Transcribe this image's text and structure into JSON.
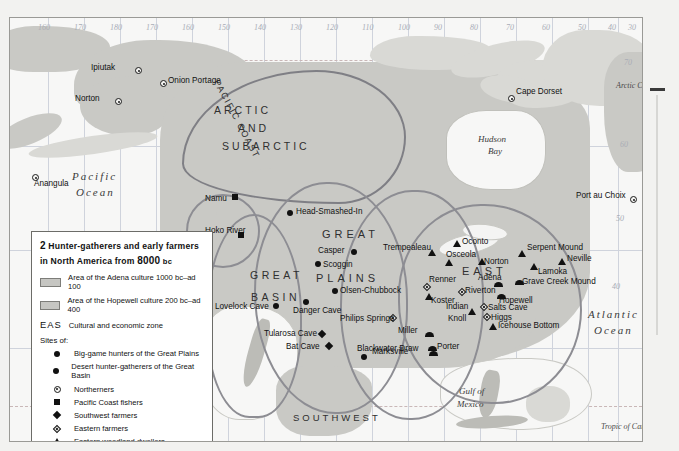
{
  "legend": {
    "number": "2",
    "title_line1": "Hunter-gatherers and early farmers",
    "title_line2_a": "in North America from",
    "title_line2_b": "8000",
    "title_line2_c": "bc",
    "swatches": [
      {
        "label": "Area of the Adena culture 1000 bc–ad 100",
        "color": "#c6c6c2"
      },
      {
        "label": "Area of the Hopewell culture 200 bc–ad 400",
        "color": "#c6c6c2"
      }
    ],
    "zone_key_abbr": "EAS",
    "zone_key_label": "Cultural and economic zone",
    "sites_header": "Sites of:",
    "site_types": [
      {
        "symbol": "filled-circle",
        "label": "Big-game hunters of the Great Plains"
      },
      {
        "symbol": "filled-circle",
        "label": "Desert hunter-gatherers of the Great Basin"
      },
      {
        "symbol": "ringed-circle",
        "label": "Northerners"
      },
      {
        "symbol": "filled-square",
        "label": "Pacific Coast fishers"
      },
      {
        "symbol": "filled-diamond",
        "label": "Southwest farmers"
      },
      {
        "symbol": "open-diamond",
        "label": "Eastern farmers"
      },
      {
        "symbol": "filled-triangle",
        "label": "Eastern woodland dwellers"
      },
      {
        "symbol": "dome",
        "label": "Eastern moundbuilders"
      }
    ]
  },
  "regions": [
    {
      "label": "ARCTIC",
      "x": 204,
      "y": 86,
      "size": 10.5,
      "spacing": 3
    },
    {
      "label": "AND",
      "x": 228,
      "y": 104,
      "size": 10.5,
      "spacing": 3
    },
    {
      "label": "SUBARCTIC",
      "x": 212,
      "y": 122,
      "size": 10.5,
      "spacing": 3
    },
    {
      "label": "GREAT",
      "x": 312,
      "y": 210,
      "size": 11,
      "spacing": 4
    },
    {
      "label": "PLAINS",
      "x": 306,
      "y": 254,
      "size": 11,
      "spacing": 4
    },
    {
      "label": "GREAT",
      "x": 240,
      "y": 251,
      "size": 10.5,
      "spacing": 3.5
    },
    {
      "label": "BASIN",
      "x": 241,
      "y": 273,
      "size": 10.5,
      "spacing": 3.5
    },
    {
      "label": "EAST",
      "x": 452,
      "y": 247,
      "size": 11,
      "spacing": 4
    },
    {
      "label": "SOUTHWEST",
      "x": 283,
      "y": 394,
      "size": 9.5,
      "spacing": 3
    },
    {
      "label": "PACIFIC COAST",
      "x": 183,
      "y": 96,
      "size": 9,
      "spacing": 1.5,
      "rot": 62
    }
  ],
  "oceans": [
    {
      "label": "Pacific",
      "x": 62,
      "y": 152,
      "size": 11
    },
    {
      "label": "Ocean",
      "x": 66,
      "y": 168,
      "size": 11
    },
    {
      "label": "Atlantic",
      "x": 578,
      "y": 290,
      "size": 11
    },
    {
      "label": "Ocean",
      "x": 584,
      "y": 306,
      "size": 11
    }
  ],
  "geo_labels": [
    {
      "label": "Hudson",
      "x": 468,
      "y": 116
    },
    {
      "label": "Bay",
      "x": 478,
      "y": 128
    },
    {
      "label": "Gulf of",
      "x": 449,
      "y": 368
    },
    {
      "label": "Mexico",
      "x": 447,
      "y": 381
    },
    {
      "label": "Arctic Circle",
      "x": 606,
      "y": 63
    },
    {
      "label": "Tropic of Cancer",
      "x": 591,
      "y": 404
    }
  ],
  "lon_labels": [
    "160",
    "170",
    "180",
    "170",
    "160",
    "150",
    "140",
    "130",
    "120",
    "110",
    "100",
    "90",
    "80",
    "70",
    "60",
    "50",
    "40",
    "30"
  ],
  "lat_labels": [
    "70",
    "60",
    "50",
    "40"
  ],
  "sites": [
    {
      "name": "Ipiutak",
      "type": "ringed-circle",
      "x": 125,
      "y": 49,
      "lx": -44,
      "ly": -4
    },
    {
      "name": "Onion Portage",
      "type": "ringed-circle",
      "x": 150,
      "y": 62,
      "lx": 8,
      "ly": -4
    },
    {
      "name": "Norton",
      "type": "ringed-circle",
      "x": 105,
      "y": 80,
      "lx": -40,
      "ly": -4
    },
    {
      "name": "Anangula",
      "type": "ringed-circle",
      "x": 22,
      "y": 156,
      "lx": 2,
      "ly": 5
    },
    {
      "name": "Cape Dorset",
      "type": "ringed-circle",
      "x": 498,
      "y": 77,
      "lx": 8,
      "ly": -8
    },
    {
      "name": "Port au Choix",
      "type": "ringed-circle",
      "x": 620,
      "y": 178,
      "lx": -54,
      "ly": -5
    },
    {
      "name": "Namu",
      "type": "filled-square",
      "x": 222,
      "y": 176,
      "lx": -27,
      "ly": 0
    },
    {
      "name": "Hoko River",
      "type": "filled-square",
      "x": 228,
      "y": 214,
      "lx": -33,
      "ly": -6
    },
    {
      "name": "Head-Smashed-In",
      "type": "filled-circle",
      "x": 277,
      "y": 192,
      "lx": 9,
      "ly": -3
    },
    {
      "name": "Casper",
      "type": "filled-circle",
      "x": 341,
      "y": 231,
      "lx": -33,
      "ly": -3
    },
    {
      "name": "Scoggin",
      "type": "filled-circle",
      "x": 305,
      "y": 243,
      "lx": 8,
      "ly": -1
    },
    {
      "name": "Olsen-Chubbock",
      "type": "filled-circle",
      "x": 322,
      "y": 270,
      "lx": 8,
      "ly": -2
    },
    {
      "name": "Lovelock Cave",
      "type": "filled-circle",
      "x": 263,
      "y": 285,
      "lx": -58,
      "ly": -1
    },
    {
      "name": "Danger Cave",
      "type": "filled-circle",
      "x": 293,
      "y": 281,
      "lx": -10,
      "ly": 7
    },
    {
      "name": "Tularosa Cave",
      "type": "filled-diamond",
      "x": 309,
      "y": 313,
      "lx": -55,
      "ly": -2
    },
    {
      "name": "Bat Cave",
      "type": "filled-diamond",
      "x": 316,
      "y": 325,
      "lx": -40,
      "ly": -1
    },
    {
      "name": "Blackwater Draw",
      "type": "filled-circle",
      "x": 351,
      "y": 336,
      "lx": -4,
      "ly": -10
    },
    {
      "name": "Philips Springs",
      "type": "open-diamond",
      "x": 380,
      "y": 297,
      "lx": -50,
      "ly": -1
    },
    {
      "name": "Renner",
      "type": "open-diamond",
      "x": 414,
      "y": 266,
      "lx": 5,
      "ly": -9
    },
    {
      "name": "Koster",
      "type": "filled-triangle",
      "x": 415,
      "y": 275,
      "lx": 6,
      "ly": 3
    },
    {
      "name": "Trempealeau",
      "type": "filled-triangle",
      "x": 418,
      "y": 231,
      "lx": -45,
      "ly": -6
    },
    {
      "name": "Oconto",
      "type": "filled-triangle",
      "x": 443,
      "y": 222,
      "lx": 9,
      "ly": -3
    },
    {
      "name": "Osceola",
      "type": "filled-triangle",
      "x": 435,
      "y": 241,
      "lx": 1,
      "ly": -9
    },
    {
      "name": "Norton",
      "type": "filled-triangle",
      "x": 468,
      "y": 240,
      "lx": 6,
      "ly": -1
    },
    {
      "name": "Riverton",
      "type": "open-diamond",
      "x": 449,
      "y": 271,
      "lx": 6,
      "ly": -3
    },
    {
      "name": "Indian",
      "type": "filled-triangle",
      "x": 458,
      "y": 290,
      "lx": -22,
      "ly": -6
    },
    {
      "name": "Knoll",
      "type": "label-only",
      "x": 438,
      "y": 296,
      "lx": 0,
      "ly": 0
    },
    {
      "name": "Salts Cave",
      "type": "open-diamond",
      "x": 471,
      "y": 286,
      "lx": 7,
      "ly": -1
    },
    {
      "name": "Higgs",
      "type": "open-diamond",
      "x": 474,
      "y": 296,
      "lx": 7,
      "ly": -1
    },
    {
      "name": "Adena",
      "type": "dome",
      "x": 484,
      "y": 264,
      "lx": -16,
      "ly": -9
    },
    {
      "name": "Hopewell",
      "type": "dome",
      "x": 487,
      "y": 276,
      "lx": 2,
      "ly": 2
    },
    {
      "name": "Grave Creek Mound",
      "type": "dome",
      "x": 505,
      "y": 262,
      "lx": 7,
      "ly": -3
    },
    {
      "name": "Serpent Mound",
      "type": "filled-triangle",
      "x": 508,
      "y": 232,
      "lx": 9,
      "ly": -7
    },
    {
      "name": "Neville",
      "type": "filled-triangle",
      "x": 548,
      "y": 240,
      "lx": 9,
      "ly": -4
    },
    {
      "name": "Lamoka",
      "type": "filled-triangle",
      "x": 520,
      "y": 245,
      "lx": 8,
      "ly": 4
    },
    {
      "name": "Icehouse Bottom",
      "type": "filled-triangle",
      "x": 479,
      "y": 305,
      "lx": 9,
      "ly": -2
    },
    {
      "name": "Miller",
      "type": "dome",
      "x": 415,
      "y": 314,
      "lx": -27,
      "ly": -6
    },
    {
      "name": "Porter",
      "type": "dome",
      "x": 418,
      "y": 328,
      "lx": 9,
      "ly": -4
    },
    {
      "name": "Marksville",
      "type": "dome",
      "x": 419,
      "y": 333,
      "lx": -57,
      "ly": -4
    }
  ]
}
